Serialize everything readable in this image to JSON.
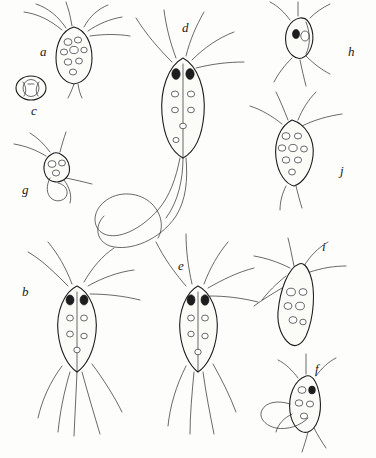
{
  "plate": {
    "title": "",
    "caption": "",
    "background_color": "#fdfdfb",
    "ink_color": "#1d1d1d",
    "width": 376,
    "height": 458,
    "figure_labels": [
      {
        "id": "a",
        "text": "a",
        "x": 40,
        "y": 52,
        "subject": "pear-shaped flagellate with anterior flagella"
      },
      {
        "id": "c",
        "text": "c",
        "x": 31,
        "y": 111,
        "subject": "small encysted oval organism"
      },
      {
        "id": "g",
        "text": "g",
        "x": 22,
        "y": 190,
        "subject": "small rounded flagellate with trailing flagella"
      },
      {
        "id": "b",
        "text": "b",
        "x": 22,
        "y": 292,
        "subject": "large elongate flagellate with long flagella"
      },
      {
        "id": "d",
        "text": "d",
        "x": 182,
        "y": 28,
        "subject": "large flagellate with very long trailing flagellum"
      },
      {
        "id": "e",
        "text": "e",
        "x": 178,
        "y": 266,
        "subject": "elongate flagellate with spread flagella"
      },
      {
        "id": "h",
        "text": "h",
        "x": 348,
        "y": 52,
        "subject": "small oval organism with dark inclusion"
      },
      {
        "id": "j",
        "text": "j",
        "x": 340,
        "y": 171,
        "subject": "granulated ovoid flagellate"
      },
      {
        "id": "i",
        "text": "i",
        "x": 322,
        "y": 247,
        "subject": "triangular granulated organism"
      },
      {
        "id": "f",
        "text": "f",
        "x": 315,
        "y": 369,
        "subject": "ovoid organism with looping flagellum"
      }
    ]
  }
}
